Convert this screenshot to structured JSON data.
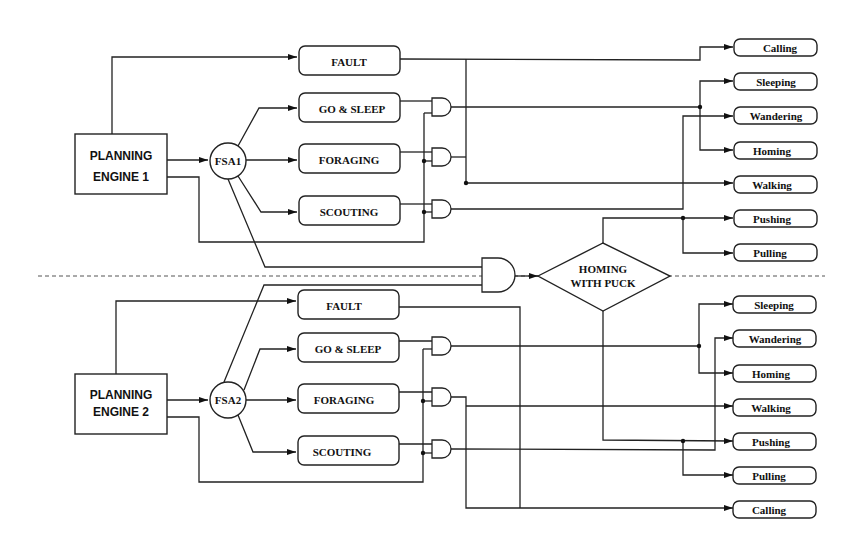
{
  "diagram": {
    "section1": {
      "planning_engine": [
        "PLANNING",
        "ENGINE 1"
      ],
      "fsa": "FSA1",
      "behaviors": {
        "fault": "FAULT",
        "go_sleep": "GO & SLEEP",
        "foraging": "FORAGING",
        "scouting": "SCOUTING"
      },
      "outputs": [
        "Calling",
        "Sleeping",
        "Wandering",
        "Homing",
        "Walking",
        "Pushing",
        "Pulling"
      ]
    },
    "shared": {
      "homing_with_puck": [
        "HOMING",
        "WITH PUCK"
      ]
    },
    "section2": {
      "planning_engine": [
        "PLANNING",
        "ENGINE 2"
      ],
      "fsa": "FSA2",
      "behaviors": {
        "fault": "FAULT",
        "go_sleep": "GO & SLEEP",
        "foraging": "FORAGING",
        "scouting": "SCOUTING"
      },
      "outputs": [
        "Sleeping",
        "Wandering",
        "Homing",
        "Walking",
        "Pushing",
        "Pulling",
        "Calling"
      ]
    }
  }
}
